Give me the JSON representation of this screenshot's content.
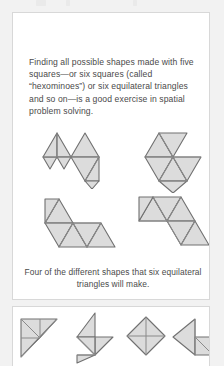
{
  "page": {
    "background": "#f2f2f2",
    "card_background": "#ffffff",
    "card_border": "#d8d8d8"
  },
  "figure_style": {
    "fill": "#dcdcdc",
    "stroke": "#707070",
    "inner_stroke": "#8a8a8a"
  },
  "main_card": {
    "body_text": "Finding all possible shapes made with five squares—or six squares (called “hexominoes”) or six equilateral triangles and so on—is a good exercise in spatial problem solving.",
    "caption": "Four of the different shapes that six equilateral triangles will make."
  },
  "hexiamond_figures": [
    {
      "name": "hexiamond-shape-1",
      "label": "hexiamond arrow-cluster"
    },
    {
      "name": "hexiamond-shape-2",
      "label": "hexiamond butterfly"
    },
    {
      "name": "hexiamond-shape-3",
      "label": "hexiamond boat"
    },
    {
      "name": "hexiamond-shape-4",
      "label": "hexiamond zigzag strip"
    }
  ],
  "lower_card": {
    "shapes": [
      {
        "name": "tangram-shape-1",
        "label": "divided right triangle"
      },
      {
        "name": "tangram-shape-2",
        "label": "stacked triangle pinwheel"
      },
      {
        "name": "tangram-shape-3",
        "label": "quartered diamond"
      },
      {
        "name": "tangram-shape-4",
        "label": "arrow with square"
      }
    ]
  },
  "toolbar_ghosts": [
    {
      "name": "toolbar-ghost-icon-1"
    },
    {
      "name": "toolbar-ghost-icon-2"
    },
    {
      "name": "toolbar-ghost-icon-3"
    }
  ]
}
